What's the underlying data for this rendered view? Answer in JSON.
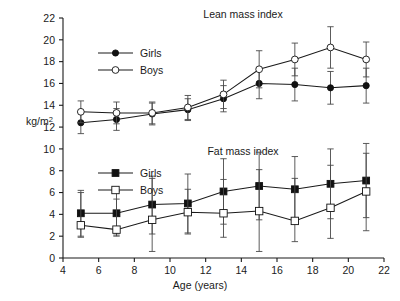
{
  "chart_data": {
    "type": "line",
    "title": "",
    "xlabel": "Age (years)",
    "ylabel": "kg/m2",
    "ylabel_display": "kg/m",
    "ylabel_superscript": "2",
    "xlim": [
      4,
      22
    ],
    "ylim": [
      0,
      22
    ],
    "xticks": [
      4,
      6,
      8,
      10,
      12,
      14,
      16,
      18,
      20,
      22
    ],
    "yticks": [
      0,
      2,
      4,
      6,
      8,
      10,
      12,
      14,
      16,
      18,
      20,
      22
    ],
    "grid": false,
    "legend_position": "upper-left (one legend per panel)",
    "x": [
      5,
      7,
      9,
      11,
      13,
      15,
      17,
      19,
      21
    ],
    "panels": [
      {
        "name": "lean-mass-panel",
        "label": "Lean mass index",
        "series": [
          {
            "name": "Girls",
            "marker": "filled-circle",
            "values": [
              12.4,
              12.7,
              13.2,
              13.6,
              14.6,
              16.0,
              15.9,
              15.6,
              15.8
            ],
            "err_low": [
              11.4,
              11.7,
              12.2,
              12.6,
              13.4,
              14.6,
              14.4,
              14.1,
              14.2
            ],
            "err_high": [
              13.4,
              13.7,
              14.2,
              14.6,
              15.8,
              17.4,
              17.4,
              17.1,
              17.4
            ]
          },
          {
            "name": "Boys",
            "marker": "open-circle",
            "values": [
              13.4,
              13.3,
              13.3,
              13.8,
              15.0,
              17.3,
              18.2,
              19.3,
              18.2
            ],
            "err_low": [
              12.4,
              12.3,
              12.3,
              12.7,
              13.7,
              15.6,
              16.7,
              17.4,
              16.6
            ],
            "err_high": [
              14.4,
              14.3,
              14.3,
              14.9,
              16.3,
              19.0,
              19.7,
              21.2,
              19.8
            ]
          }
        ]
      },
      {
        "name": "fat-mass-panel",
        "label": "Fat mass index",
        "series": [
          {
            "name": "Girls",
            "marker": "filled-square",
            "values": [
              4.1,
              4.1,
              4.9,
              5.0,
              6.1,
              6.6,
              6.3,
              6.8,
              7.1
            ],
            "err_low": [
              2.0,
              2.1,
              2.2,
              2.3,
              3.1,
              3.5,
              3.3,
              3.6,
              3.7
            ],
            "err_high": [
              6.2,
              6.1,
              7.5,
              7.7,
              9.1,
              9.7,
              9.3,
              10.0,
              10.5
            ]
          },
          {
            "name": "Boys",
            "marker": "open-square",
            "values": [
              3.0,
              2.6,
              3.5,
              4.2,
              4.1,
              4.3,
              3.4,
              4.6,
              6.1
            ],
            "err_low": [
              1.9,
              2.0,
              0.6,
              2.2,
              1.9,
              0.6,
              1.5,
              1.8,
              2.5
            ],
            "err_high": [
              6.0,
              5.4,
              7.3,
              6.3,
              7.2,
              8.1,
              7.3,
              8.5,
              9.6
            ]
          }
        ]
      }
    ]
  },
  "colors": {
    "axis": "#1a1a1a",
    "marker_fill": "#111111",
    "marker_open_fill": "#ffffff",
    "error_bar": "#4a4a4a",
    "background": "#ffffff"
  }
}
